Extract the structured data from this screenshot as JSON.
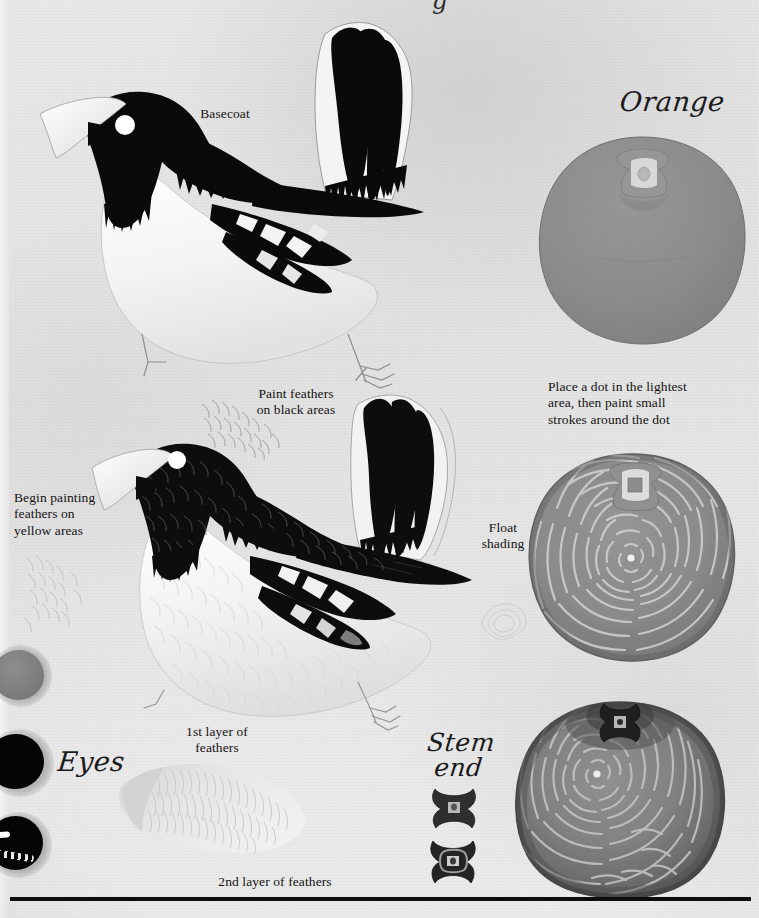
{
  "page": {
    "medium": "acrylic painting instruction plate",
    "background_color": "#e6e6e6",
    "ink_color": "#131313",
    "rule_color": "#0d0d0d"
  },
  "labels": {
    "basecoat": "Basecoat",
    "orange_title": "Orange",
    "place_dot": "Place a dot in the lightest\narea, then paint small\nstrokes around the dot",
    "paint_feathers_black": "Paint feathers\non black areas",
    "begin_painting_yellow": "Begin painting\nfeathers on\nyellow areas",
    "float_shading": "Float\nshading",
    "eyes_title": "Eyes",
    "first_layer": "1st layer of\nfeathers",
    "stem_end_title": "Stem\nend",
    "second_layer": "2nd layer of feathers"
  },
  "birds": [
    {
      "name": "basecoat-bird",
      "stage": "Basecoat",
      "head_color": "#0a0a0a",
      "body_color": "#f2f2f2",
      "beak_color": "#fbfbfb",
      "eye_color": "#ffffff",
      "wing_color": "#0a0a0a",
      "has_feather_texture": false
    },
    {
      "name": "feathered-bird",
      "stage": "Feathers on black and yellow areas",
      "head_color": "#0d0d0d",
      "body_color": "#f0f0f0",
      "beak_color": "#fcfcfc",
      "eye_color": "#ffffff",
      "wing_color": "#101010",
      "has_feather_texture": true
    }
  ],
  "oranges": [
    {
      "name": "orange-basecoat",
      "stage": "Basecoat",
      "fill_color": "#8c8c8c",
      "stroke_texture": false,
      "shading": false,
      "stem_highlight_color": "#cfcfcf"
    },
    {
      "name": "orange-strokes",
      "stage": "Small strokes around the dot",
      "fill_color": "#868686",
      "stroke_texture": true,
      "stroke_color": "#cdcdcd",
      "shading": false,
      "center_dot_color": "#f2f2f2"
    },
    {
      "name": "orange-float-shaded",
      "stage": "Float shading",
      "fill_color": "#7a7a7a",
      "stroke_texture": true,
      "stroke_color": "#c4c4c4",
      "shading": true,
      "shadow_color": "#4f4f4f",
      "center_dot_color": "#ededed"
    }
  ],
  "eyes": [
    {
      "name": "eye-basecoat",
      "stage": "Basecoat",
      "fill_color": "#7d7d7d",
      "highlight": false
    },
    {
      "name": "eye-black",
      "stage": "Black",
      "fill_color": "#050505",
      "highlight": false
    },
    {
      "name": "eye-highlight",
      "stage": "Highlight",
      "fill_color": "#050505",
      "highlight": true,
      "highlight_color": "#ffffff"
    }
  ],
  "stem_ends": [
    {
      "name": "stem-end-basecoat",
      "fill_color": "#2e2e2e"
    },
    {
      "name": "stem-end-detailed",
      "fill_color": "#242424"
    }
  ],
  "swatches": [
    {
      "name": "first-layer-feather-swatch",
      "tone": "#d8d8d8"
    },
    {
      "name": "second-layer-feather-swatch",
      "tone": "#e4e4e4"
    },
    {
      "name": "yellow-area-feather-swatch",
      "tone": "#d4d4d4"
    },
    {
      "name": "black-area-feather-swatch",
      "tone": "#9a9a9a"
    },
    {
      "name": "float-shading-swatch",
      "tone": "#cfcfcf"
    }
  ],
  "clipped_top_glyph": "g"
}
